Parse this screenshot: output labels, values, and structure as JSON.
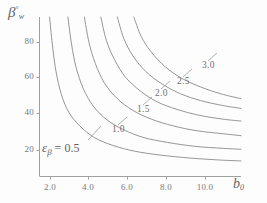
{
  "chart_data": {
    "type": "line",
    "title": "",
    "subtitle": "",
    "xlabel": "b_0",
    "ylabel": "beta_w (deg)",
    "xlim": [
      1.0,
      12.0
    ],
    "ylim": [
      10,
      92
    ],
    "grid": false,
    "legend_position": "inline-contour-labels",
    "x_ticks": [
      {
        "value": 2.0,
        "label": "2.0",
        "px": 50
      },
      {
        "value": 4.0,
        "label": "4.0",
        "px": 88
      },
      {
        "value": 6.0,
        "label": "6.0",
        "px": 127
      },
      {
        "value": 8.0,
        "label": "8.0",
        "px": 166
      },
      {
        "value": 10.0,
        "label": "10.0",
        "px": 205
      }
    ],
    "y_ticks": [
      {
        "value": 20,
        "label": "20",
        "px": 150
      },
      {
        "value": 40,
        "label": "40",
        "px": 113
      },
      {
        "value": 60,
        "label": "60",
        "px": 77
      },
      {
        "value": 80,
        "label": "80",
        "px": 42
      }
    ],
    "annotations": [
      {
        "id": "eps-annotation",
        "text_prefix": "ε",
        "text_sub": "β",
        "text_suffix": " = 0.5",
        "full": "εβ = 0.5"
      }
    ],
    "series": [
      {
        "name": "0.5",
        "label": "εβ = 0.5",
        "label_inline": "0.5",
        "points": [
          {
            "x": 1.55,
            "y": 92
          },
          {
            "x": 1.7,
            "y": 78
          },
          {
            "x": 1.9,
            "y": 64
          },
          {
            "x": 2.2,
            "y": 52
          },
          {
            "x": 2.6,
            "y": 43
          },
          {
            "x": 3.2,
            "y": 36
          },
          {
            "x": 4.0,
            "y": 30
          },
          {
            "x": 5.0,
            "y": 26
          },
          {
            "x": 6.2,
            "y": 23
          },
          {
            "x": 7.6,
            "y": 21
          },
          {
            "x": 9.2,
            "y": 19.5
          },
          {
            "x": 10.8,
            "y": 18.5
          },
          {
            "x": 12.0,
            "y": 18
          }
        ]
      },
      {
        "name": "1.0",
        "label_inline": "1.0",
        "points": [
          {
            "x": 2.55,
            "y": 92
          },
          {
            "x": 2.75,
            "y": 78
          },
          {
            "x": 3.0,
            "y": 66
          },
          {
            "x": 3.4,
            "y": 55
          },
          {
            "x": 3.95,
            "y": 46
          },
          {
            "x": 4.7,
            "y": 39
          },
          {
            "x": 5.6,
            "y": 34
          },
          {
            "x": 6.7,
            "y": 30
          },
          {
            "x": 8.0,
            "y": 27.5
          },
          {
            "x": 9.5,
            "y": 25.5
          },
          {
            "x": 11.0,
            "y": 24.5
          },
          {
            "x": 12.0,
            "y": 24
          }
        ]
      },
      {
        "name": "1.5",
        "label_inline": "1.5",
        "points": [
          {
            "x": 3.45,
            "y": 92
          },
          {
            "x": 3.7,
            "y": 79
          },
          {
            "x": 4.05,
            "y": 68
          },
          {
            "x": 4.55,
            "y": 58
          },
          {
            "x": 5.25,
            "y": 50
          },
          {
            "x": 6.1,
            "y": 44
          },
          {
            "x": 7.1,
            "y": 39.5
          },
          {
            "x": 8.3,
            "y": 36
          },
          {
            "x": 9.6,
            "y": 33.5
          },
          {
            "x": 11.0,
            "y": 32
          },
          {
            "x": 12.0,
            "y": 31
          }
        ]
      },
      {
        "name": "2.0",
        "label_inline": "2.0",
        "points": [
          {
            "x": 4.35,
            "y": 92
          },
          {
            "x": 4.65,
            "y": 80
          },
          {
            "x": 5.1,
            "y": 70
          },
          {
            "x": 5.7,
            "y": 61
          },
          {
            "x": 6.5,
            "y": 54
          },
          {
            "x": 7.4,
            "y": 48.5
          },
          {
            "x": 8.5,
            "y": 44.5
          },
          {
            "x": 9.7,
            "y": 41.5
          },
          {
            "x": 11.0,
            "y": 39.5
          },
          {
            "x": 12.0,
            "y": 38.5
          }
        ]
      },
      {
        "name": "2.5",
        "label_inline": "2.5",
        "points": [
          {
            "x": 5.25,
            "y": 92
          },
          {
            "x": 5.6,
            "y": 81
          },
          {
            "x": 6.1,
            "y": 72
          },
          {
            "x": 6.8,
            "y": 64
          },
          {
            "x": 7.7,
            "y": 57.5
          },
          {
            "x": 8.7,
            "y": 52.5
          },
          {
            "x": 9.8,
            "y": 49
          },
          {
            "x": 11.0,
            "y": 46.5
          },
          {
            "x": 12.0,
            "y": 45
          }
        ]
      },
      {
        "name": "3.0",
        "label_inline": "3.0",
        "points": [
          {
            "x": 6.15,
            "y": 92
          },
          {
            "x": 6.55,
            "y": 82
          },
          {
            "x": 7.1,
            "y": 74
          },
          {
            "x": 7.85,
            "y": 66.5
          },
          {
            "x": 8.75,
            "y": 60.5
          },
          {
            "x": 9.8,
            "y": 56
          },
          {
            "x": 10.9,
            "y": 52.5
          },
          {
            "x": 12.0,
            "y": 50
          }
        ]
      }
    ],
    "contour_labels": [
      {
        "text": "1.0",
        "left": 112,
        "top": 124
      },
      {
        "text": "1.5",
        "left": 137,
        "top": 104
      },
      {
        "text": "2.0",
        "left": 155,
        "top": 88
      },
      {
        "text": "2.5",
        "left": 177,
        "top": 76
      },
      {
        "text": "3.0",
        "left": 202,
        "top": 60
      }
    ]
  },
  "axes": {
    "y_title_main": "β",
    "y_title_sub": "w",
    "y_title_sup": "°",
    "x_title_main": "b",
    "x_title_sub": "0"
  },
  "colors": {
    "curve": "#8a8a8a",
    "axis": "#9a9a9a",
    "text": "#6e6e6e",
    "background": "#fdfdfd"
  }
}
